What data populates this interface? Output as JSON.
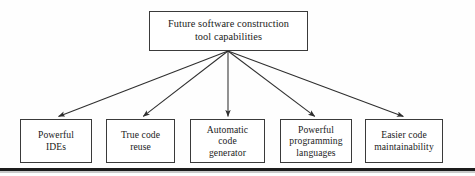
{
  "figure": {
    "type": "hierarchy-diagram",
    "background_color": "#fefefe",
    "line_color": "#3a3a3a",
    "text_color": "#1a1a1a",
    "root": {
      "id": "root",
      "label": "Future software construction\ntool capabilities"
    },
    "leaves": [
      {
        "id": "leaf-0",
        "label": "Powerful\nIDEs"
      },
      {
        "id": "leaf-1",
        "label": "True code\nreuse"
      },
      {
        "id": "leaf-2",
        "label": "Automatic\ncode\ngenerator"
      },
      {
        "id": "leaf-3",
        "label": "Powerful\nprogramming\nlanguages"
      },
      {
        "id": "leaf-4",
        "label": "Easier code\nmaintainability"
      }
    ],
    "connectors": {
      "style": "single-headed-arrow",
      "origin": {
        "x": 228,
        "y": 51
      },
      "targets": [
        {
          "x": 57,
          "y": 118
        },
        {
          "x": 142,
          "y": 118
        },
        {
          "x": 228,
          "y": 118
        },
        {
          "x": 316,
          "y": 118
        },
        {
          "x": 405,
          "y": 118
        }
      ]
    },
    "page_rule": {
      "color": "#1c1c1c",
      "shadow_color": "#c9c9c9"
    }
  }
}
